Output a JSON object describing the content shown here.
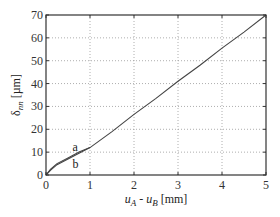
{
  "chart_data": {
    "type": "line",
    "title": "",
    "xlabel": "u_A - u_B [mm]",
    "ylabel": "δ_nn [µm]",
    "xlabel_parts": {
      "a": "u",
      "a_sub": "A",
      "mid": " - ",
      "b": "u",
      "b_sub": "B",
      "unit": " [mm]"
    },
    "ylabel_parts": {
      "sym": "δ",
      "sub": "nn",
      "unit": " [µm]"
    },
    "xlim": [
      0,
      5
    ],
    "ylim": [
      0,
      70
    ],
    "xticks": [
      0,
      1,
      2,
      3,
      4,
      5
    ],
    "yticks": [
      0,
      10,
      20,
      30,
      40,
      50,
      60,
      70
    ],
    "grid": true,
    "legend": null,
    "series": [
      {
        "name": "a",
        "x": [
          0,
          0.1,
          0.25,
          0.5,
          0.75,
          1.0,
          1.5,
          2.0,
          2.5,
          3.0,
          3.5,
          4.0,
          4.5,
          5.0
        ],
        "y": [
          0,
          2.5,
          5.0,
          7.5,
          10.0,
          12.0,
          19.0,
          26.5,
          33.5,
          41.0,
          48.0,
          55.5,
          62.5,
          70.0
        ]
      },
      {
        "name": "b",
        "x": [
          0,
          0.1,
          0.25,
          0.5,
          0.75,
          1.0
        ],
        "y": [
          0,
          2.0,
          4.5,
          7.0,
          9.5,
          12.0
        ]
      }
    ],
    "annotations": [
      {
        "text": "a",
        "x": 0.6,
        "y": 10.5
      },
      {
        "text": "b",
        "x": 0.6,
        "y": 3.0
      }
    ]
  }
}
